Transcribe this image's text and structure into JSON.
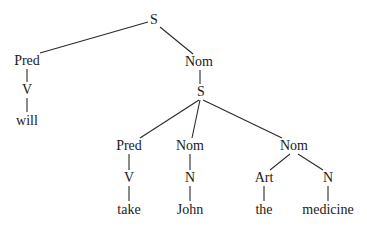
{
  "tree": {
    "type": "syntax-tree",
    "nodes": [
      {
        "id": "S1",
        "label": "S",
        "x": 154,
        "y": 20
      },
      {
        "id": "Pred1",
        "label": "Pred",
        "x": 27,
        "y": 61
      },
      {
        "id": "V1",
        "label": "V",
        "x": 27,
        "y": 90
      },
      {
        "id": "will",
        "label": "will",
        "x": 27,
        "y": 121
      },
      {
        "id": "Nom1",
        "label": "Nom",
        "x": 199,
        "y": 62
      },
      {
        "id": "S2",
        "label": "S",
        "x": 201,
        "y": 92
      },
      {
        "id": "Pred2",
        "label": "Pred",
        "x": 129,
        "y": 146
      },
      {
        "id": "V2",
        "label": "V",
        "x": 129,
        "y": 178
      },
      {
        "id": "take",
        "label": "take",
        "x": 129,
        "y": 210
      },
      {
        "id": "Nom2",
        "label": "Nom",
        "x": 190,
        "y": 146
      },
      {
        "id": "N1",
        "label": "N",
        "x": 190,
        "y": 178
      },
      {
        "id": "John",
        "label": "John",
        "x": 190,
        "y": 210
      },
      {
        "id": "Nom3",
        "label": "Nom",
        "x": 294,
        "y": 146
      },
      {
        "id": "Art",
        "label": "Art",
        "x": 264,
        "y": 178
      },
      {
        "id": "the",
        "label": "the",
        "x": 264,
        "y": 210
      },
      {
        "id": "N2",
        "label": "N",
        "x": 328,
        "y": 178
      },
      {
        "id": "medicine",
        "label": "medicine",
        "x": 328,
        "y": 210
      }
    ],
    "edges": [
      {
        "x1": 148,
        "y1": 22,
        "x2": 40,
        "y2": 53
      },
      {
        "x1": 160,
        "y1": 27,
        "x2": 193,
        "y2": 54
      },
      {
        "x1": 27,
        "y1": 69,
        "x2": 27,
        "y2": 82
      },
      {
        "x1": 27,
        "y1": 98,
        "x2": 27,
        "y2": 112
      },
      {
        "x1": 200,
        "y1": 70,
        "x2": 200,
        "y2": 84
      },
      {
        "x1": 199,
        "y1": 100,
        "x2": 140,
        "y2": 138
      },
      {
        "x1": 200,
        "y1": 100,
        "x2": 192,
        "y2": 138
      },
      {
        "x1": 203,
        "y1": 100,
        "x2": 282,
        "y2": 138
      },
      {
        "x1": 129,
        "y1": 154,
        "x2": 129,
        "y2": 170
      },
      {
        "x1": 129,
        "y1": 186,
        "x2": 129,
        "y2": 201
      },
      {
        "x1": 190,
        "y1": 154,
        "x2": 190,
        "y2": 170
      },
      {
        "x1": 190,
        "y1": 186,
        "x2": 190,
        "y2": 201
      },
      {
        "x1": 290,
        "y1": 154,
        "x2": 270,
        "y2": 170
      },
      {
        "x1": 298,
        "y1": 154,
        "x2": 323,
        "y2": 170
      },
      {
        "x1": 264,
        "y1": 186,
        "x2": 264,
        "y2": 201
      },
      {
        "x1": 328,
        "y1": 186,
        "x2": 328,
        "y2": 201
      }
    ],
    "colors": {
      "line": "#2a2a2a",
      "text": "#1a1a1a",
      "background": "#ffffff"
    }
  }
}
